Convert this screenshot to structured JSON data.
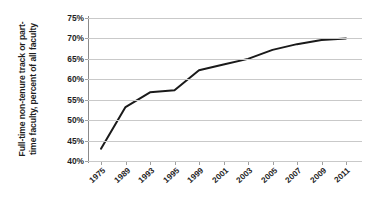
{
  "chart_data": {
    "type": "line",
    "title": "",
    "xlabel": "",
    "ylabel_lines": [
      "Full-time non-tenure track or part-",
      "time faculty, percent of all faculty"
    ],
    "ylabel": "Full-time non-tenure track or part-time faculty, percent of all faculty",
    "categories": [
      "1975",
      "1989",
      "1993",
      "1995",
      "1999",
      "2001",
      "2003",
      "2005",
      "2007",
      "2009",
      "2011"
    ],
    "x_tick_labels": [
      "1975",
      "1989",
      "1993",
      "1995",
      "1999",
      "2001",
      "2003",
      "2005",
      "2007",
      "2009",
      "2011"
    ],
    "y_tick_labels": [
      "75%",
      "70%",
      "65%",
      "60%",
      "55%",
      "50%",
      "45%",
      "40%"
    ],
    "y_tick_values": [
      75,
      70,
      65,
      60,
      55,
      50,
      45,
      40
    ],
    "ylim": [
      40,
      75
    ],
    "grid": "horizontal",
    "legend": "none",
    "series": [
      {
        "name": "Full-time non-tenure track or part-time faculty",
        "color": "#1a1a1a",
        "values": [
          43.0,
          53.2,
          56.8,
          57.3,
          62.2,
          63.6,
          65.0,
          67.2,
          68.6,
          69.6,
          70.0
        ],
        "x": [
          "1975",
          "1989",
          "1993",
          "1995",
          "1999",
          "2001",
          "2003",
          "2005",
          "2007",
          "2009",
          "2011"
        ]
      }
    ],
    "colors": {
      "line": "#1a1a1a",
      "grid": "#c9c9c9",
      "axis": "#8a8a8a",
      "text": "#1f1f1f",
      "background": "#ffffff"
    }
  }
}
